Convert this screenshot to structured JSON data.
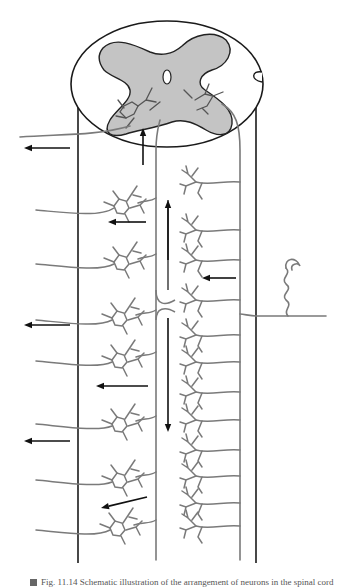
{
  "figure": {
    "colors": {
      "gray_matter": "#c4c4c4",
      "neuron": "#7a7a7a",
      "outline": "#1a1a1a",
      "arrow": "#111111"
    }
  },
  "caption": {
    "text": "Fig. 11.14 Schematic illustration of the arrangement of neurons in the spinal cord"
  },
  "arrows": [
    {
      "name": "arrow-output-1",
      "x1": 70,
      "y1": 148,
      "x2": 24,
      "y2": 148
    },
    {
      "name": "arrow-ascending-short",
      "x1": 143,
      "y1": 165,
      "x2": 143,
      "y2": 128
    },
    {
      "name": "arrow-internal-1",
      "x1": 146,
      "y1": 222,
      "x2": 108,
      "y2": 222
    },
    {
      "name": "arrow-ascending-long",
      "x1": 168,
      "y1": 260,
      "x2": 168,
      "y2": 200
    },
    {
      "name": "arrow-input",
      "x1": 236,
      "y1": 278,
      "x2": 202,
      "y2": 278
    },
    {
      "name": "arrow-output-2",
      "x1": 70,
      "y1": 325,
      "x2": 24,
      "y2": 325
    },
    {
      "name": "arrow-descending",
      "x1": 168,
      "y1": 318,
      "x2": 168,
      "y2": 432
    },
    {
      "name": "arrow-internal-2",
      "x1": 148,
      "y1": 386,
      "x2": 96,
      "y2": 386
    },
    {
      "name": "arrow-output-3",
      "x1": 70,
      "y1": 441,
      "x2": 24,
      "y2": 441
    },
    {
      "name": "arrow-internal-3",
      "x1": 147,
      "y1": 497,
      "x2": 101,
      "y2": 508
    }
  ],
  "left_neurons": [
    {
      "cx": 120,
      "cy": 206,
      "axon_y": 212
    },
    {
      "cx": 120,
      "cy": 262,
      "axon_y": 266
    },
    {
      "cx": 118,
      "cy": 318,
      "axon_y": 322
    },
    {
      "cx": 118,
      "cy": 360,
      "axon_y": 363
    },
    {
      "cx": 118,
      "cy": 424,
      "axon_y": 426
    },
    {
      "cx": 118,
      "cy": 480,
      "axon_y": 482
    },
    {
      "cx": 116,
      "cy": 528,
      "axon_y": 532
    }
  ],
  "right_dendrites": [
    {
      "y": 182
    },
    {
      "y": 230
    },
    {
      "y": 260
    },
    {
      "y": 300
    },
    {
      "y": 335
    },
    {
      "y": 362
    },
    {
      "y": 392
    },
    {
      "y": 420
    },
    {
      "y": 450
    },
    {
      "y": 476
    },
    {
      "y": 503
    },
    {
      "y": 526
    }
  ]
}
